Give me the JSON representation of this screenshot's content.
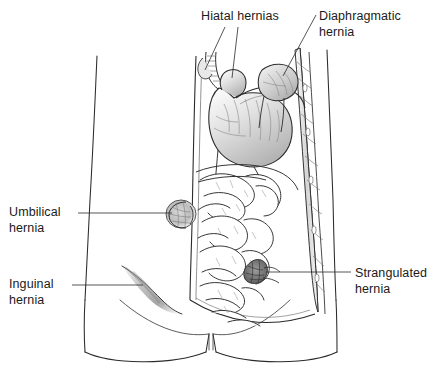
{
  "figure": {
    "background_color": "#ffffff",
    "ink_color": "#1a1a1a",
    "shading_color": "#9a9a9a"
  },
  "labels": {
    "hiatal": {
      "text": "Hiatal hernias",
      "lines": [
        "Hiatal hernias"
      ]
    },
    "diaphragmatic": {
      "text": "Diaphragmatic hernia",
      "lines": [
        "Diaphragmatic",
        "hernia"
      ]
    },
    "umbilical": {
      "text": "Umbilical hernia",
      "lines": [
        "Umbilical",
        "hernia"
      ]
    },
    "inguinal": {
      "text": "Inguinal hernia",
      "lines": [
        "Inguinal",
        "hernia"
      ]
    },
    "strangulated": {
      "text": "Strangulated hernia",
      "lines": [
        "Strangulated",
        "hernia"
      ]
    }
  },
  "anatomy": {
    "parts": [
      "torso-outline",
      "thigh-left",
      "thigh-right",
      "abdominal-wall-cutaway",
      "rib-cage-edge",
      "esophagus",
      "stomach",
      "diaphragm",
      "small-intestine-coils",
      "umbilical-hernia-bulge",
      "inguinal-hernia-swelling",
      "strangulated-hernia-knot",
      "diaphragmatic-hernia-sac"
    ]
  }
}
